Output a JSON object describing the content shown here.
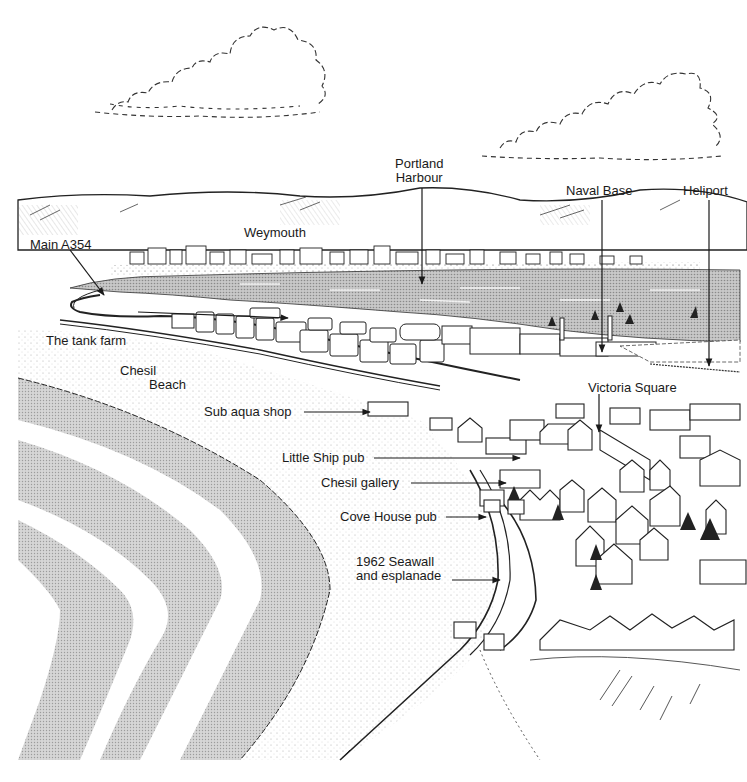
{
  "colors": {
    "ink": "#1a1a1a",
    "sea_shade": "#9a9a9a",
    "beach_shade": "#b5b5b5",
    "paper": "#ffffff"
  },
  "labels": {
    "portland_harbour": {
      "line1": "Portland",
      "line2": "Harbour"
    },
    "naval_base": "Naval Base",
    "heliport": "Heliport",
    "weymouth": "Weymouth",
    "main_a354": "Main A354",
    "tank_farm": "The tank farm",
    "chesil_beach": {
      "line1": "Chesil",
      "line2": "Beach"
    },
    "sub_aqua_shop": "Sub aqua shop",
    "victoria_square": "Victoria Square",
    "little_ship_pub": "Little Ship pub",
    "chesil_gallery": "Chesil gallery",
    "cove_house_pub": "Cove House pub",
    "seawall": {
      "line1": "1962 Seawall",
      "line2": "and esplanade"
    }
  },
  "icons": {
    "clouds": "cloud-icon",
    "boats": "sailboat-icon",
    "arrows": "arrow-pointer-icon"
  }
}
